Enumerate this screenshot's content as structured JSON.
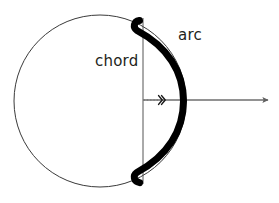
{
  "figure": {
    "background_color": "#ffffff",
    "width": 279,
    "height": 203
  },
  "labels": {
    "chord": "chord",
    "arc": "arc"
  },
  "colors": {
    "circle_outline": "#3a3a3a",
    "arc_stroke": "#000000",
    "chord_stroke": "#555555",
    "axis_stroke": "#6e6e6e",
    "dotted_stroke": "#777777",
    "text": "#231f20"
  },
  "geometry": {
    "circle": {
      "center_x": 100,
      "center_y": 101,
      "radius": 86,
      "stroke_width": 1
    },
    "chord": {
      "x": 143,
      "y_top": 18,
      "y_bottom": 184,
      "stroke_width": 1
    },
    "arc": {
      "start_x": 140,
      "start_y": 20,
      "end_x": 140,
      "end_y": 183,
      "bulge_x": 185,
      "stroke_width": 7
    },
    "axis": {
      "x_start": 143,
      "x_end": 272,
      "y": 100,
      "stroke_width": 1.6,
      "arrowhead": "right"
    },
    "sagitta_dotted": {
      "x_start": 143,
      "x_end": 160,
      "y": 100
    },
    "chevron_marker": {
      "x": 162,
      "y": 100,
      "glyph": "double-chevron-right"
    }
  }
}
